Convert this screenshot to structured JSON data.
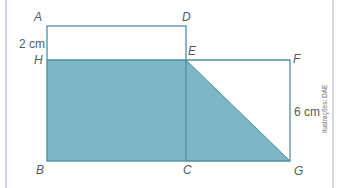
{
  "figure": {
    "points": {
      "A": "A",
      "B": "B",
      "C": "C",
      "D": "D",
      "E": "E",
      "F": "F",
      "G": "G",
      "H": "H"
    },
    "measurements": {
      "ah": "2 cm",
      "fg": "6 cm"
    },
    "credit": "Ilustrações: DAE",
    "colors": {
      "fill": "#7fb6c6",
      "stroke": "#4e8ea3",
      "frame": "#cfd3e6"
    }
  }
}
